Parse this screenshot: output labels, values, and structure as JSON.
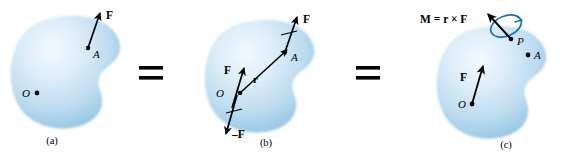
{
  "figure": {
    "type": "mechanics-diagram",
    "background_color": "#ffffff",
    "body_fill_light": "#e4f0fa",
    "body_fill_mid": "#bcdcf0",
    "body_fill_edge": "#8cc2e2",
    "ink_color": "#000000",
    "moment_curve_color": "#1f6fb5"
  },
  "equals_signs": [
    {
      "name": "equals-1",
      "symbol": "="
    },
    {
      "name": "equals-2",
      "symbol": "="
    }
  ],
  "panels": [
    {
      "id": "a",
      "caption": "(a)",
      "points": [
        {
          "label": "A",
          "name": "point-a"
        },
        {
          "label": "O",
          "name": "point-o"
        }
      ],
      "vectors": [
        {
          "label": "F",
          "name": "force-vector-f",
          "from": "A",
          "description": "force F applied at point A directed up and to the right"
        }
      ]
    },
    {
      "id": "b",
      "caption": "(b)",
      "points": [
        {
          "label": "A",
          "name": "point-a"
        },
        {
          "label": "O",
          "name": "point-o"
        }
      ],
      "vectors": [
        {
          "label": "F",
          "name": "force-vector-f-at-a",
          "from": "A",
          "description": "original force F at A"
        },
        {
          "label": "F",
          "name": "force-vector-f-at-o",
          "from": "O",
          "description": "added force F at O, parallel to original"
        },
        {
          "label": "–F",
          "name": "force-vector-negative-f-at-o",
          "from": "O",
          "description": "added force minus F at O"
        },
        {
          "label": "r",
          "name": "position-vector-r",
          "from": "O",
          "to": "A",
          "description": "position vector r from O to A"
        }
      ]
    },
    {
      "id": "c",
      "caption": "(c)",
      "points": [
        {
          "label": "P",
          "name": "point-p"
        },
        {
          "label": "A",
          "name": "point-a"
        },
        {
          "label": "O",
          "name": "point-o"
        }
      ],
      "vectors": [
        {
          "label": "F",
          "name": "force-vector-f-at-o",
          "from": "O",
          "description": "force F acting at O"
        },
        {
          "label": "M = r × F",
          "name": "moment-vector-m",
          "from": "P",
          "description": "couple moment vector M equal to r cross F, drawn with a circular rotation arrow"
        }
      ]
    }
  ]
}
